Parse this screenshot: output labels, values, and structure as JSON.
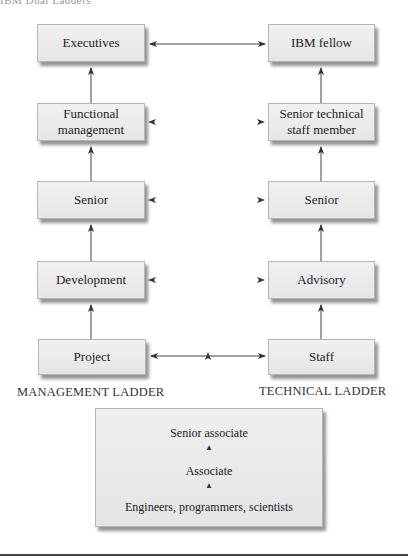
{
  "header": {
    "cut_text": "IBM Dual Ladders"
  },
  "management_ladder": {
    "label": "MANAGEMENT LADDER",
    "boxes": [
      {
        "label": "Executives"
      },
      {
        "label": "Functional management"
      },
      {
        "label": "Senior"
      },
      {
        "label": "Development"
      },
      {
        "label": "Project"
      }
    ]
  },
  "technical_ladder": {
    "label": "TECHNICAL LADDER",
    "boxes": [
      {
        "label": "IBM fellow"
      },
      {
        "label": "Senior technical staff member"
      },
      {
        "label": "Senior"
      },
      {
        "label": "Advisory"
      },
      {
        "label": "Staff"
      }
    ]
  },
  "entry_levels": {
    "items": [
      {
        "label": "Senior associate"
      },
      {
        "label": "Associate"
      },
      {
        "label": "Engineers, programmers, scientists"
      }
    ]
  },
  "colors": {
    "box_fill": "#ececec",
    "box_border": "#b5b5b5",
    "line": "#333333",
    "shadow": "#3c3c3c"
  }
}
